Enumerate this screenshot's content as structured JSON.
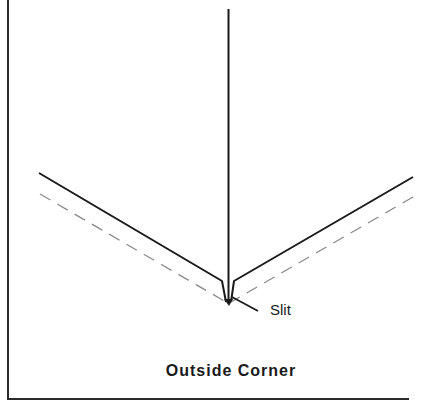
{
  "diagram": {
    "title": "Outside Corner",
    "labels": {
      "slit": "Slit"
    },
    "elements": [
      {
        "name": "vertical-cut-line",
        "style": "solid",
        "description": "vertical line from top to slit"
      },
      {
        "name": "left-edge-solid",
        "style": "solid",
        "description": "left outer edge of corner"
      },
      {
        "name": "right-edge-solid",
        "style": "solid",
        "description": "right outer edge of corner"
      },
      {
        "name": "left-edge-dashed",
        "style": "dashed",
        "description": "left fold line"
      },
      {
        "name": "right-edge-dashed",
        "style": "dashed",
        "description": "right fold line"
      },
      {
        "name": "slit-leader",
        "style": "solid",
        "description": "leader line to Slit label"
      }
    ],
    "colors": {
      "line": "#1a1a1a",
      "dashed": "#8a8a8a",
      "background": "#ffffff"
    }
  }
}
